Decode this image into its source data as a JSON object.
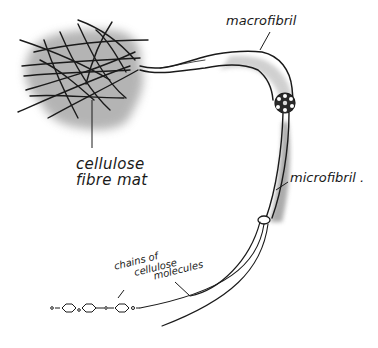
{
  "diagram": {
    "labels": {
      "mat_line1": "cellulose",
      "mat_line2": "fibre mat",
      "macrofibril": "macrofibril",
      "microfibril": "microfibril .",
      "chains_line1": "chains of",
      "chains_line2": "cellulose",
      "chains_line3": "molecules"
    },
    "colors": {
      "ink": "#1a1a1a",
      "shade": "#9a9a9a",
      "background": "#ffffff"
    },
    "components": [
      {
        "id": "fibre-mat",
        "label": "cellulose fibre mat"
      },
      {
        "id": "macrofibril",
        "label": "macrofibril"
      },
      {
        "id": "microfibril",
        "label": "microfibril"
      },
      {
        "id": "cellulose-chains",
        "label": "chains of cellulose molecules"
      }
    ]
  }
}
